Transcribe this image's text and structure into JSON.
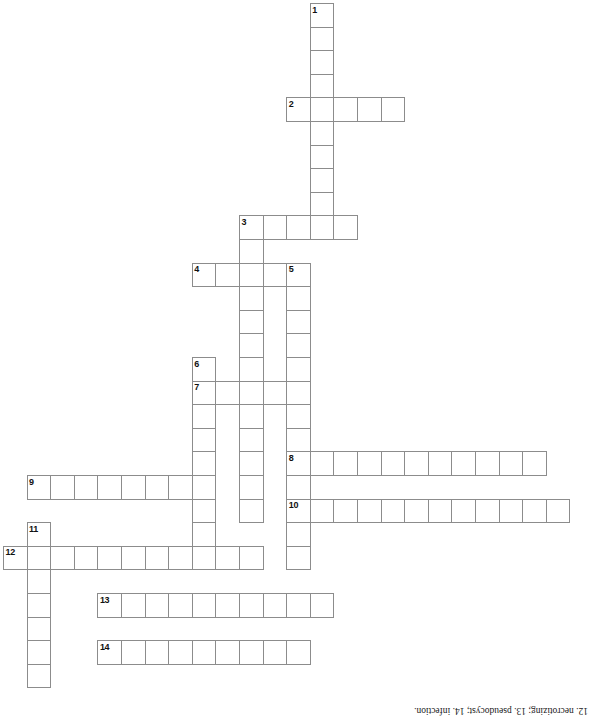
{
  "document": {
    "type": "crossword-puzzle",
    "title": "Crossword Puzzle Grid",
    "grid": {
      "cell_size": 23.6,
      "origin_x": 3,
      "origin_y": 3,
      "columns": 25,
      "rows": 30
    }
  },
  "answer_key": {
    "text": "12. necrotizing; 13. pseudocyst; 14. infection.",
    "rotated": "180deg"
  },
  "entries": [
    {
      "number": "1",
      "direction": "down",
      "col": 13,
      "row": 0,
      "length": 10
    },
    {
      "number": "2",
      "direction": "across",
      "col": 12,
      "row": 4,
      "length": 5
    },
    {
      "number": "3",
      "direction": "across",
      "col": 10,
      "row": 9,
      "length": 5
    },
    {
      "number": "4",
      "direction": "across",
      "col": 8,
      "row": 11,
      "length": 4
    },
    {
      "number": "5",
      "direction": "down",
      "col": 12,
      "row": 11,
      "length": 13
    },
    {
      "number": "6",
      "direction": "down",
      "col": 8,
      "row": 15,
      "length": 9
    },
    {
      "number": "7",
      "direction": "across",
      "col": 8,
      "row": 16,
      "length": 5
    },
    {
      "number": "8",
      "direction": "across",
      "col": 12,
      "row": 19,
      "length": 11
    },
    {
      "number": "9",
      "direction": "across",
      "col": 1,
      "row": 20,
      "length": 8
    },
    {
      "number": "10",
      "direction": "across",
      "col": 12,
      "row": 21,
      "length": 12
    },
    {
      "number": "11",
      "direction": "down",
      "col": 1,
      "row": 22,
      "length": 7
    },
    {
      "number": "12",
      "direction": "across",
      "col": 0,
      "row": 23,
      "length": 11
    },
    {
      "number": "13",
      "direction": "across",
      "col": 4,
      "row": 25,
      "length": 10
    },
    {
      "number": "14",
      "direction": "across",
      "col": 4,
      "row": 27,
      "length": 9
    }
  ],
  "extra_cells": [
    {
      "col": 10,
      "row": 10
    },
    {
      "col": 10,
      "row": 11
    },
    {
      "col": 10,
      "row": 12
    },
    {
      "col": 10,
      "row": 13
    },
    {
      "col": 10,
      "row": 14
    },
    {
      "col": 10,
      "row": 15
    },
    {
      "col": 10,
      "row": 17
    },
    {
      "col": 10,
      "row": 18
    },
    {
      "col": 10,
      "row": 19
    },
    {
      "col": 10,
      "row": 20
    },
    {
      "col": 10,
      "row": 21
    },
    {
      "col": 8,
      "row": 23
    },
    {
      "col": 9,
      "row": 23
    },
    {
      "col": 10,
      "row": 23
    }
  ]
}
